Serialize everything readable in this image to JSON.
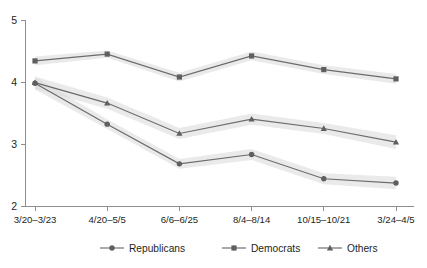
{
  "chart_data": {
    "type": "line",
    "title": "",
    "xlabel": "",
    "ylabel": "",
    "categories": [
      "3/20–3/23",
      "4/20–5/5",
      "6/6–6/25",
      "8/4–8/14",
      "10/15–10/21",
      "3/24–4/5"
    ],
    "ylim": [
      2,
      5
    ],
    "yticks": [
      2,
      3,
      4,
      5
    ],
    "ytick_labels": [
      "2",
      "3",
      "4",
      "5"
    ],
    "grid": false,
    "legend_position": "bottom",
    "confidence_bands": true,
    "band_color": "#d9d9d9",
    "line_color": "#6b6b6b",
    "marker_color": "#5f5f5f",
    "series": [
      {
        "name": "Republicans",
        "marker": "circle",
        "values": [
          3.98,
          3.32,
          2.68,
          2.83,
          2.44,
          2.37
        ],
        "band_low": [
          3.88,
          3.24,
          2.6,
          2.74,
          2.35,
          2.27
        ],
        "band_high": [
          4.08,
          3.4,
          2.76,
          2.92,
          2.53,
          2.47
        ]
      },
      {
        "name": "Democrats",
        "marker": "square",
        "values": [
          4.34,
          4.45,
          4.08,
          4.42,
          4.2,
          4.05
        ],
        "band_low": [
          4.27,
          4.39,
          4.01,
          4.35,
          4.13,
          3.97
        ],
        "band_high": [
          4.41,
          4.51,
          4.15,
          4.49,
          4.27,
          4.13
        ]
      },
      {
        "name": "Others",
        "marker": "triangle",
        "values": [
          3.99,
          3.66,
          3.17,
          3.4,
          3.25,
          3.03
        ],
        "band_low": [
          3.89,
          3.57,
          3.08,
          3.31,
          3.16,
          2.92
        ],
        "band_high": [
          4.09,
          3.75,
          3.26,
          3.49,
          3.34,
          3.14
        ]
      }
    ]
  },
  "legend": {
    "items": [
      {
        "label": "Republicans",
        "marker": "circle"
      },
      {
        "label": "Democrats",
        "marker": "square"
      },
      {
        "label": "Others",
        "marker": "triangle"
      }
    ]
  }
}
